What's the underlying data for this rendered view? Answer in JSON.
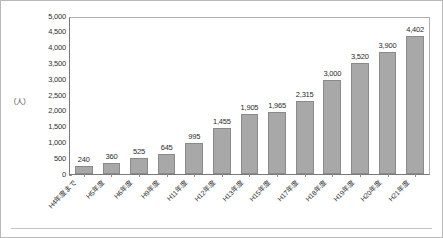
{
  "chart_data": {
    "type": "bar",
    "title": "",
    "subtitle": "",
    "xlabel": "",
    "ylabel": "（人）",
    "unit_label": "（人）",
    "ylim": [
      0,
      5000
    ],
    "ytick_step": 500,
    "grid": false,
    "legend": "none",
    "orientation": "vertical",
    "bar_color": "#a8a8a8",
    "bar_border_color": "#8a8a8a",
    "ytick_labels": [
      "5,000",
      "4,500",
      "4,000",
      "3,500",
      "3,000",
      "2,500",
      "2,000",
      "1,500",
      "1,000",
      "500",
      "0"
    ],
    "ytick_values": [
      5000,
      4500,
      4000,
      3500,
      3000,
      2500,
      2000,
      1500,
      1000,
      500,
      0
    ],
    "categories": [
      "H4年度まで",
      "H5年度",
      "H6年度",
      "H9年度",
      "H11年度",
      "H12年度",
      "H13年度",
      "H15年度",
      "H17年度",
      "H18年度",
      "H19年度",
      "H20年度",
      "H21年度"
    ],
    "values": [
      240,
      360,
      525,
      645,
      995,
      1455,
      1905,
      1965,
      2315,
      3000,
      3520,
      3900,
      4402
    ],
    "value_labels": [
      "240",
      "360",
      "525",
      "645",
      "995",
      "1,455",
      "1,905",
      "1,965",
      "2,315",
      "3,000",
      "3,520",
      "3,900",
      "4,402"
    ]
  }
}
